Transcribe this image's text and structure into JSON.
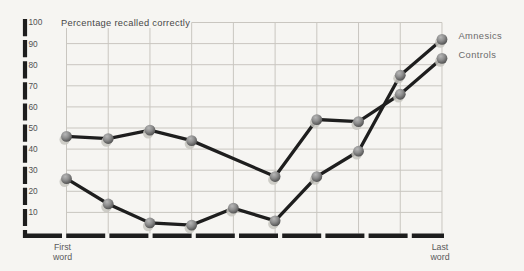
{
  "figure": {
    "background": "#f6f5f2",
    "grid_color": "#c9c6c0",
    "axis_color": "#1d1d1d",
    "series_line_color": "#1e1e1e",
    "title_color": "#474747",
    "tick_label_color": "#525252",
    "axis_word_label_color": "#5a5a5a",
    "legend_label_color": "#6a6a6a",
    "marker_colors": {
      "highlight": "#b7b7b7",
      "mid": "#8e8e8e",
      "edge": "#474747",
      "shadow": "#c7c5c0"
    }
  },
  "chart_data": {
    "type": "line",
    "title": "Percentage recalled correctly",
    "xlabel": "",
    "ylabel": "Percentage recalled correctly",
    "x_positions": [
      1,
      2,
      3,
      4,
      5,
      6,
      7,
      8,
      9,
      10
    ],
    "x_first_label": [
      "First",
      "word"
    ],
    "x_last_label": [
      "Last",
      "word"
    ],
    "ylim": [
      0,
      100
    ],
    "yticks": [
      100,
      90,
      80,
      70,
      60,
      50,
      40,
      30,
      20,
      10
    ],
    "grid": true,
    "legend_position": "right-of-last-points",
    "series": [
      {
        "name": "Amnesics",
        "values": [
          26,
          14,
          5,
          4,
          12,
          6,
          27,
          39,
          75,
          92
        ]
      },
      {
        "name": "Controls",
        "values": [
          46,
          45,
          49,
          44,
          null,
          27,
          54,
          53,
          66,
          83
        ]
      }
    ]
  }
}
